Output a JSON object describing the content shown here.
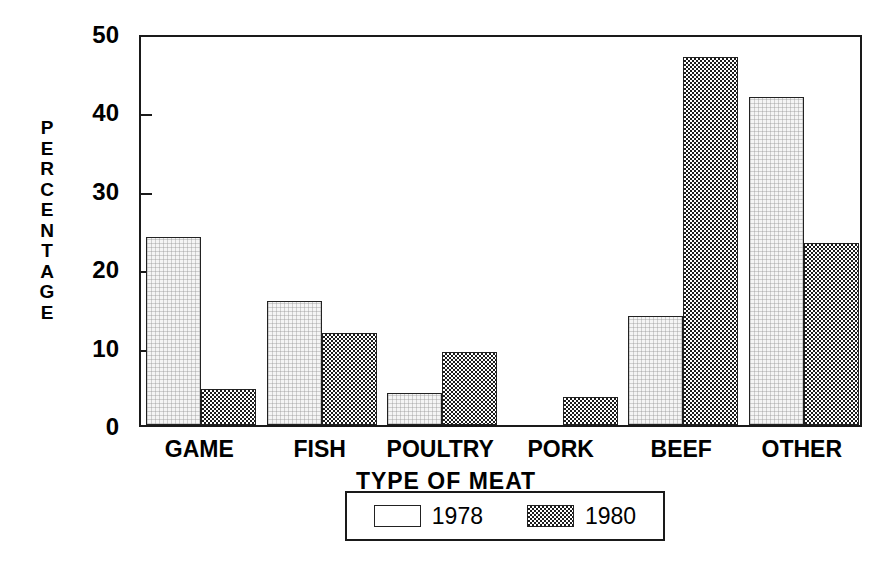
{
  "chart_data": {
    "type": "bar",
    "title": "",
    "xlabel": "TYPE OF MEAT",
    "ylabel": "PERCENTAGE",
    "categories": [
      "GAME",
      "FISH",
      "POULTRY",
      "PORK",
      "BEEF",
      "OTHER"
    ],
    "series": [
      {
        "name": "1978",
        "values": [
          24.0,
          15.8,
          4.1,
          0,
          13.9,
          41.8
        ]
      },
      {
        "name": "1980",
        "values": [
          4.6,
          11.8,
          9.3,
          3.6,
          47.0,
          23.2
        ]
      }
    ],
    "ylim": [
      0,
      50
    ],
    "yticks": [
      0,
      10,
      20,
      30,
      40,
      50
    ],
    "ytick_labels": [
      "0",
      "10",
      "20",
      "30",
      "40",
      "50"
    ],
    "grid": false,
    "legend_position": "bottom-center",
    "legend_entries": [
      "1978",
      "1980"
    ]
  },
  "axes": {
    "y_title_letters": [
      "P",
      "E",
      "R",
      "C",
      "E",
      "N",
      "T",
      "A",
      "G",
      "E"
    ],
    "x_title": "TYPE OF MEAT"
  },
  "colors": {
    "frame": "#1a1a1a",
    "series_1978_fill": "#f5f5f5",
    "series_1980_fill": "#1c1c1c",
    "background": "#ffffff",
    "text": "#000000"
  }
}
